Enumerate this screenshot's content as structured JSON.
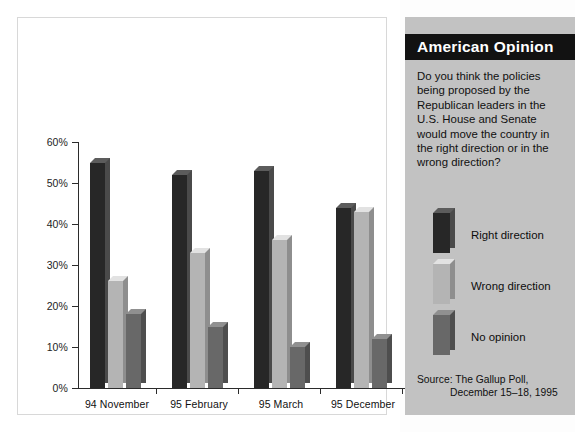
{
  "panel": {
    "banner_title": "American Opinion",
    "question": "Do you think the policies being proposed by the Republican leaders in the U.S. House and Senate would move the country in the right direction or in the wrong direction?",
    "source_label": "Source: The Gallup Poll,",
    "source_detail": "December 15–18, 1995",
    "colors": {
      "panel_background": "#c2c2c2",
      "banner_background": "#121212",
      "banner_text": "#ffffff"
    }
  },
  "legend": {
    "items": [
      {
        "label": "Right direction",
        "color": "#272727",
        "swatch_name": "legend-swatch-right-direction"
      },
      {
        "label": "Wrong direction",
        "color": "#b4b4b4",
        "swatch_name": "legend-swatch-wrong-direction"
      },
      {
        "label": "No opinion",
        "color": "#686868",
        "swatch_name": "legend-swatch-no-opinion"
      }
    ]
  },
  "chart_data": {
    "type": "bar",
    "title": "American Opinion",
    "xlabel": "",
    "ylabel": "",
    "ylim": [
      0,
      60
    ],
    "yticks": [
      0,
      10,
      20,
      30,
      40,
      50,
      60
    ],
    "ytick_labels": [
      "0%",
      "10%",
      "20%",
      "30%",
      "40%",
      "50%",
      "60%"
    ],
    "grid": false,
    "legend_position": "right",
    "categories": [
      "94 November",
      "95 February",
      "95 March",
      "95 December"
    ],
    "series": [
      {
        "name": "Right direction",
        "color": "#272727",
        "values": [
          55,
          52,
          53,
          44
        ]
      },
      {
        "name": "Wrong direction",
        "color": "#b4b4b4",
        "values": [
          26,
          33,
          36,
          43
        ]
      },
      {
        "name": "No opinion",
        "color": "#686868",
        "values": [
          18,
          15,
          10,
          12
        ]
      }
    ]
  }
}
